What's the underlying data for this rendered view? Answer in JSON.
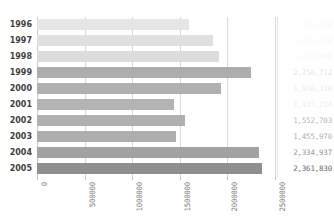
{
  "chart_data": {
    "type": "bar",
    "orientation": "horizontal",
    "title": "",
    "xlabel": "",
    "ylabel": "",
    "categories": [
      "1996",
      "1997",
      "1998",
      "1999",
      "2000",
      "2001",
      "2002",
      "2003",
      "2004",
      "2005"
    ],
    "values": [
      1595000,
      1845000,
      1910000,
      2250712,
      1930318,
      1437214,
      1552703,
      1455970,
      2334937,
      2361830
    ],
    "value_labels": [
      "1,595,000",
      "1,845,000",
      "1,910,000",
      "2,250,712",
      "1,930,318",
      "1,437,214",
      "1,552,703",
      "1,455,970",
      "2,334,937",
      "2,361,830"
    ],
    "bar_colors": [
      "#e6e6e6",
      "#e0e0e0",
      "#dcdcdc",
      "#adadad",
      "#b0b0b0",
      "#b4b4b4",
      "#b0b0b0",
      "#aeaeae",
      "#a2a2a2",
      "#8f8f8f"
    ],
    "label_colors": [
      "#fafafa",
      "#fafafa",
      "#f8f8f8",
      "#e8e8e8",
      "#ededed",
      "#f0f0f0",
      "#b9b9b9",
      "#b0b0b0",
      "#9a9a9a",
      "#6d6d6d"
    ],
    "xlim": [
      0,
      2500000
    ],
    "xticks": [
      0,
      500000,
      1000000,
      1500000,
      2000000,
      2500000
    ],
    "xtick_labels": [
      "0",
      "500000",
      "1000000",
      "1500000",
      "2000000",
      "2500000"
    ],
    "grid": true,
    "grid_axis": "x",
    "legend": false,
    "value_labels_visible": true
  }
}
